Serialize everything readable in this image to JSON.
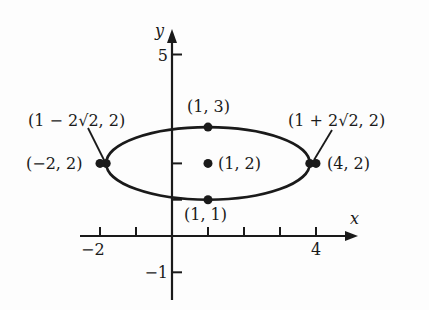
{
  "figure": {
    "colors": {
      "ink": "#1a1a1a",
      "background": "#fdfdfd"
    },
    "axes": {
      "x_label": "x",
      "y_label": "y",
      "x_ticks": [
        -2,
        -1,
        1,
        2,
        3,
        4
      ],
      "y_ticks": [
        -1,
        1,
        2,
        5
      ],
      "x_tick_labels": [
        {
          "value": -2,
          "text": "−2"
        },
        {
          "value": 4,
          "text": "4"
        }
      ],
      "y_tick_labels": [
        {
          "value": 5,
          "text": "5"
        },
        {
          "value": -1,
          "text": "−1"
        }
      ],
      "xlim": [
        -2.6,
        5.0
      ],
      "ylim": [
        -1.8,
        6.2
      ]
    },
    "ellipse": {
      "center": [
        1,
        2
      ],
      "semi_major": 2.828,
      "semi_minor": 1,
      "equation": "(x-1)^2/8 + (y-2)^2 = 1"
    },
    "points": [
      {
        "id": "center",
        "x": 1,
        "y": 2,
        "label": "(1, 2)"
      },
      {
        "id": "top",
        "x": 1,
        "y": 3,
        "label": "(1, 3)"
      },
      {
        "id": "bottom",
        "x": 1,
        "y": 1,
        "label": "(1, 1)"
      },
      {
        "id": "left-vertex",
        "x": -1.828,
        "y": 2,
        "label": "(1 − 2√2, 2)"
      },
      {
        "id": "right-vertex",
        "x": 3.828,
        "y": 2,
        "label": "(1 + 2√2, 2)"
      },
      {
        "id": "left-point",
        "x": -2,
        "y": 2,
        "label": "(−2, 2)"
      },
      {
        "id": "right-point",
        "x": 4,
        "y": 2,
        "label": "(4, 2)"
      }
    ]
  }
}
